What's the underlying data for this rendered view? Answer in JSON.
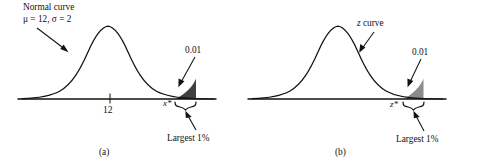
{
  "figure": {
    "type": "statistical-diagram",
    "background_color": "#ffffff",
    "ink_color": "#121212",
    "panels": [
      {
        "id": "a",
        "caption": "(a)",
        "curve_label_line1": "Normal curve",
        "curve_label_line2": "μ = 12, σ = 2",
        "mean_tick_label": "12",
        "critical_value_label": "x*",
        "tail_area_label": "0.01",
        "brace_label": "Largest 1%",
        "shade_color": "#3f3f3f"
      },
      {
        "id": "b",
        "caption": "(b)",
        "curve_label_line1": "z curve",
        "curve_label_line2": "",
        "mean_tick_label": "",
        "critical_value_label": "z*",
        "tail_area_label": "0.01",
        "brace_label": "Largest 1%",
        "shade_color": "#8c8c8c"
      }
    ]
  },
  "chart_data": {
    "type": "line",
    "title": "",
    "xlabel": "",
    "ylabel": "",
    "curves": [
      {
        "name": "Normal curve, mu = 12, sigma = 2",
        "panel": "a",
        "mean": 12,
        "sd": 2,
        "mean_tick": "12",
        "critical_value": "x*",
        "tail_area": 0.01,
        "tail_side": "upper",
        "tail_percent_label": "Largest 1%"
      },
      {
        "name": "z curve",
        "panel": "b",
        "mean": 0,
        "sd": 1,
        "mean_tick": "",
        "critical_value": "z*",
        "tail_area": 0.01,
        "tail_side": "upper",
        "tail_percent_label": "Largest 1%"
      }
    ]
  }
}
